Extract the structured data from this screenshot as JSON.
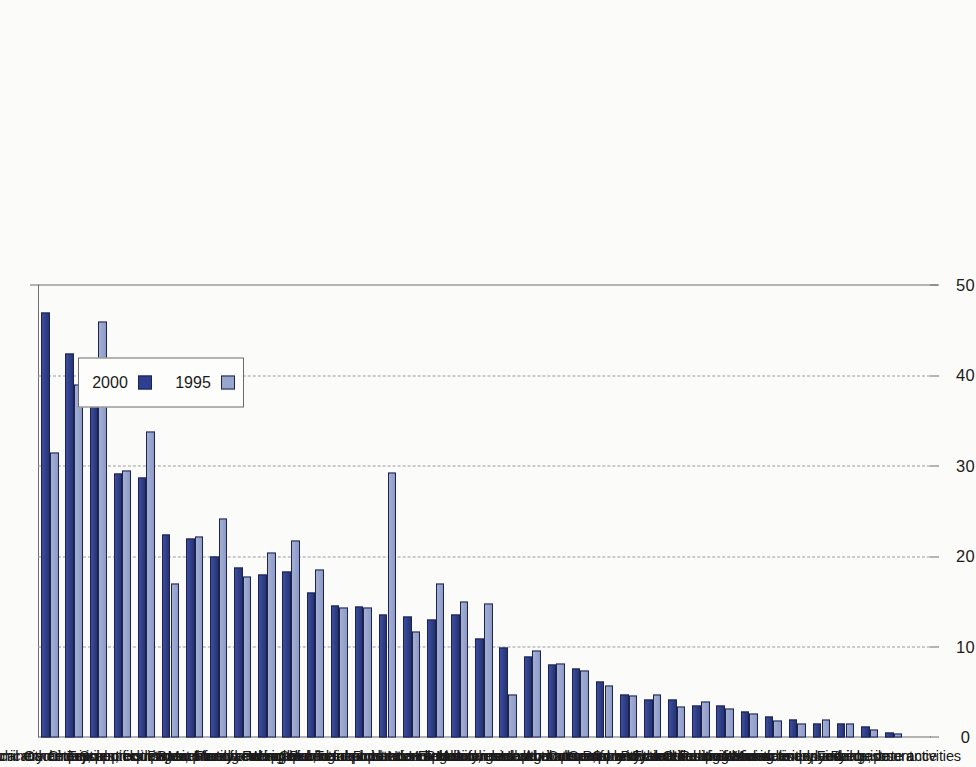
{
  "chart_data": {
    "type": "bar",
    "title": "",
    "subtitle": "",
    "xlabel": "",
    "ylabel": "%",
    "ylim": [
      0,
      50
    ],
    "yticks": [
      0,
      10,
      20,
      30,
      40,
      50
    ],
    "grid": true,
    "grid_axis": "value",
    "orientation": "rotated-90",
    "legend": {
      "position": "top-center",
      "entries": [
        "1995",
        "2000"
      ]
    },
    "colors": {
      "series_1995": "#98a5cd",
      "series_2000": "#2f3f8f",
      "bar_outline": "#1d2250",
      "axis": "#6f6f6f",
      "gridline": "#9b9b9b",
      "background": "#fbfbf9",
      "text": "#1a1a1a"
    },
    "categories": [
      "Radio, TV, communication equip.",
      "Electrical machinery, nec",
      "Office machinery and computers",
      "Chemical products",
      "Other transport equipment",
      "Scientific instruments",
      "Basic metals",
      "Textiles, clothing and footw ear",
      "Wood",
      "Manufacturing nec",
      "Paper, printing and publishing",
      "Machinery and equipment nec",
      "Food, beverages and tobacco",
      "Fabricated metal products",
      "Coke, refined petroleum",
      "Transport and storage",
      "Rubber and plastics",
      "Public administration and defence",
      "Motor vehicles",
      "Hotels and restaurants",
      "Non-metallic mineral products",
      "Research and development",
      "Electricity, gas and w ater supply",
      "Health and social w ork",
      "Construction",
      "Education",
      "Agriculture, forestry and fishing",
      "Computer and related activities",
      "Post and telecommunications",
      "Community, soc. and pers. services",
      "Other business activities",
      "Private households w ith employed",
      "Mining and quarrying",
      "Wholesale and retail trade",
      "Renting of machinery and equipment",
      "Finance, insurance",
      "Real estate activities"
    ],
    "series": [
      {
        "name": "2000",
        "color": "#2f3f8f",
        "values": [
          47.0,
          42.5,
          41.5,
          29.2,
          28.8,
          22.5,
          22.0,
          20.0,
          18.8,
          18.0,
          18.4,
          16.0,
          14.6,
          14.5,
          13.6,
          13.4,
          13.0,
          13.6,
          11.0,
          10.0,
          9.0,
          8.1,
          7.6,
          6.2,
          4.8,
          4.2,
          4.2,
          3.5,
          3.5,
          2.9,
          2.3,
          2.0,
          1.5,
          1.6,
          1.2,
          0.5,
          0.0
        ]
      },
      {
        "name": "1995",
        "color": "#98a5cd",
        "values": [
          31.5,
          39.0,
          46.0,
          29.5,
          33.8,
          17.0,
          22.2,
          24.2,
          17.8,
          20.5,
          21.8,
          18.6,
          14.4,
          14.4,
          29.3,
          11.7,
          17.0,
          15.0,
          14.8,
          4.8,
          9.6,
          8.2,
          7.4,
          5.8,
          4.7,
          4.8,
          3.4,
          4.0,
          3.2,
          2.6,
          1.9,
          1.6,
          2.0,
          1.5,
          0.9,
          0.4,
          0.0
        ]
      }
    ]
  }
}
